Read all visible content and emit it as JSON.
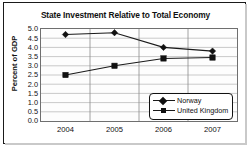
{
  "chart_data": {
    "type": "line",
    "title": "State Investment Relative to Total Economy",
    "xlabel": "",
    "ylabel": "Percent of GDP",
    "categories": [
      "2004",
      "2005",
      "2006",
      "2007"
    ],
    "series": [
      {
        "name": "Norway",
        "marker": "diamond",
        "color": "#111111",
        "values": [
          4.7,
          4.8,
          4.0,
          3.8
        ]
      },
      {
        "name": "United Kingdom",
        "marker": "square",
        "color": "#111111",
        "values": [
          2.5,
          3.0,
          3.4,
          3.45
        ]
      }
    ],
    "ylim": [
      0.0,
      5.0
    ],
    "ytick_labels": [
      "5.0",
      "4.5",
      "4.0",
      "3.5",
      "3.0",
      "2.5",
      "2.0",
      "1.5",
      "1.0",
      "0.5",
      "0.0"
    ],
    "ytick_values": [
      5.0,
      4.5,
      4.0,
      3.5,
      3.0,
      2.5,
      2.0,
      1.5,
      1.0,
      0.5,
      0.0
    ],
    "grid": "both",
    "legend_position": "lower-right",
    "background_color": "#ffffff",
    "plot_border_color": "#6f6f6f",
    "grid_color": "#b3b3b3",
    "line_color": "#1a1a1a"
  },
  "legend": {
    "entries": [
      {
        "label": "Norway",
        "marker": "diamond-marker"
      },
      {
        "label": "United Kingdom",
        "marker": "square-marker"
      }
    ]
  }
}
